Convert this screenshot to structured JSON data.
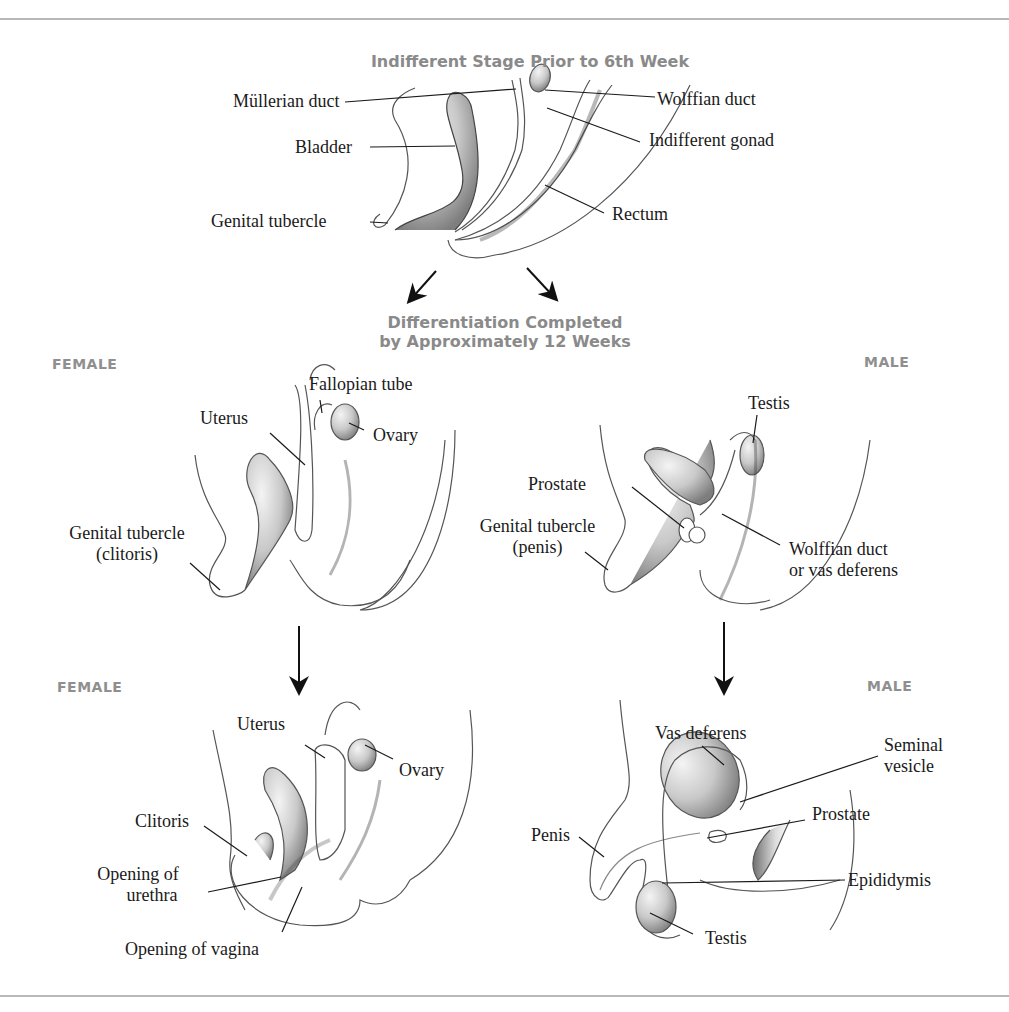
{
  "top_section": {
    "title": "Indifferent Stage Prior to 6th Week",
    "labels": {
      "mullerian_duct": "Müllerian duct",
      "wolffian_duct": "Wolffian duct",
      "bladder": "Bladder",
      "indifferent_gonad": "Indifferent gonad",
      "genital_tubercle": "Genital tubercle",
      "rectum": "Rectum"
    }
  },
  "middle_heading": {
    "line1": "Differentiation Completed",
    "line2": "by Approximately 12 Weeks"
  },
  "female_12wk": {
    "tag": "FEMALE",
    "labels": {
      "fallopian_tube": "Fallopian tube",
      "uterus": "Uterus",
      "ovary": "Ovary",
      "genital_tubercle_line1": "Genital tubercle",
      "genital_tubercle_line2": "(clitoris)"
    }
  },
  "male_12wk": {
    "tag": "MALE",
    "labels": {
      "testis": "Testis",
      "prostate": "Prostate",
      "genital_tubercle_line1": "Genital tubercle",
      "genital_tubercle_line2": "(penis)",
      "wolffian_line1": "Wolffian duct",
      "wolffian_line2": "or vas deferens"
    }
  },
  "female_final": {
    "tag": "FEMALE",
    "labels": {
      "uterus": "Uterus",
      "ovary": "Ovary",
      "clitoris": "Clitoris",
      "urethra_line1": "Opening of",
      "urethra_line2": "urethra",
      "vagina": "Opening of vagina"
    }
  },
  "male_final": {
    "tag": "MALE",
    "labels": {
      "vas_deferens": "Vas deferens",
      "seminal_line1": "Seminal",
      "seminal_line2": "vesicle",
      "prostate": "Prostate",
      "penis": "Penis",
      "epididymis": "Epididymis",
      "testis": "Testis"
    }
  },
  "colors": {
    "heading_gray": "#8a8a8a",
    "rule_gray": "#b8b8b8",
    "label_black": "#1a1a1a"
  }
}
